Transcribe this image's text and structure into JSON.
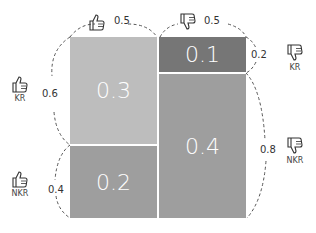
{
  "diagram": {
    "type": "mosaic-probability",
    "cells": [
      {
        "id": "kr_pos",
        "value": "0.3",
        "color": "#bdbdbd"
      },
      {
        "id": "nkr_pos",
        "value": "0.2",
        "color": "#9e9e9e"
      },
      {
        "id": "kr_neg",
        "value": "0.1",
        "color": "#767676"
      },
      {
        "id": "nkr_neg",
        "value": "0.4",
        "color": "#9e9e9e"
      }
    ],
    "top_labels": {
      "positive": {
        "icon": "thumbs-up-icon",
        "value": "0.5"
      },
      "negative": {
        "icon": "thumbs-down-icon",
        "value": "0.5"
      }
    },
    "left_labels": {
      "kr": {
        "icon": "thumbs-up-icon",
        "text": "KR",
        "value": "0.6"
      },
      "nkr": {
        "icon": "thumbs-up-icon",
        "text": "NKR",
        "value": "0.4"
      }
    },
    "right_labels": {
      "kr": {
        "icon": "thumbs-down-icon",
        "text": "KR",
        "value": "0.2"
      },
      "nkr": {
        "icon": "thumbs-down-icon",
        "text": "NKR",
        "value": "0.8"
      }
    }
  }
}
